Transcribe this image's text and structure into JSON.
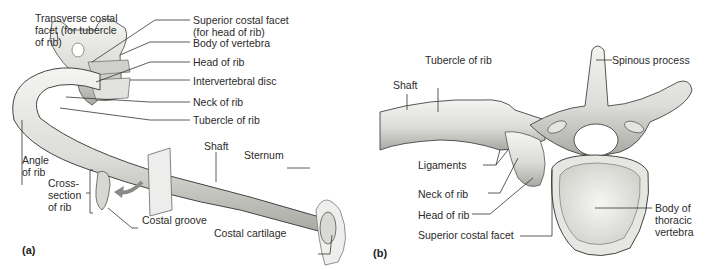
{
  "panel_a": {
    "tag": "(a)",
    "labels": {
      "transverse_costal_facet": "Transverse costal\nfacet (for tubercle\nof rib)",
      "superior_costal_facet": "Superior costal facet\n(for head of rib)",
      "body_of_vertebra": "Body of vertebra",
      "head_of_rib": "Head of rib",
      "intervertebral_disc": "Intervertebral disc",
      "neck_of_rib": "Neck of rib",
      "tubercle_of_rib": "Tubercle of rib",
      "shaft": "Shaft",
      "sternum": "Sternum",
      "angle_of_rib": "Angle\nof rib",
      "cross_section": "Cross-\nsection\nof rib",
      "costal_groove": "Costal groove",
      "costal_cartilage": "Costal cartilage"
    }
  },
  "panel_b": {
    "tag": "(b)",
    "labels": {
      "shaft": "Shaft",
      "tubercle_of_rib": "Tubercle of rib",
      "spinous_process": "Spinous process",
      "ligaments": "Ligaments",
      "neck_of_rib": "Neck of rib",
      "head_of_rib": "Head of rib",
      "superior_costal_facet": "Superior costal facet",
      "body_of_thoracic_vertebra": "Body of\nthoracic\nvertebra"
    }
  }
}
